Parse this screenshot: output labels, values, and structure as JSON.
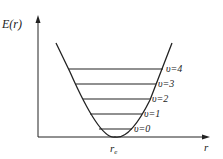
{
  "diagram": {
    "y_axis_label": "E(r)",
    "x_axis_label": "r",
    "equilibrium_label": "r",
    "equilibrium_subscript": "e",
    "levels": [
      {
        "label": "υ=0"
      },
      {
        "label": "υ=1"
      },
      {
        "label": "υ=2"
      },
      {
        "label": "υ=3"
      },
      {
        "label": "υ=4"
      }
    ],
    "colors": {
      "line": "#222222",
      "background": "#ffffff"
    }
  }
}
